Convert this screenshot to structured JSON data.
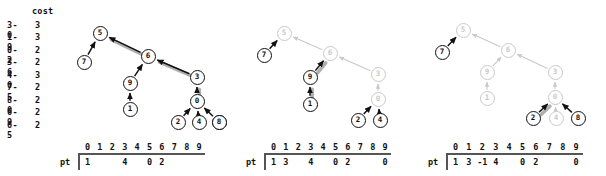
{
  "cost_table": {
    "header": "cost",
    "rows": [
      {
        "pair": "3-0",
        "cost": "3"
      },
      {
        "pair": "1-9",
        "cost": "3"
      },
      {
        "pair": "0-2",
        "cost": "2"
      },
      {
        "pair": "3-6",
        "cost": "2"
      },
      {
        "pair": "4-0",
        "cost": "3"
      },
      {
        "pair": "7-5",
        "cost": "2"
      },
      {
        "pair": "8-0",
        "cost": "2"
      },
      {
        "pair": "6-9",
        "cost": "2"
      },
      {
        "pair": "6-5",
        "cost": "2"
      }
    ]
  },
  "colors": {
    "ink": "#111111",
    "dim": "#c9c9c9",
    "highlight": "#b0b0b0",
    "rule": "#555555"
  },
  "panels": [
    {
      "name": "panel-1",
      "nodes": [
        {
          "id": "5",
          "x": 100,
          "y": 33,
          "state": "active"
        },
        {
          "id": "7",
          "x": 84,
          "y": 62,
          "state": "active"
        },
        {
          "id": "6",
          "x": 148,
          "y": 56,
          "state": "active"
        },
        {
          "id": "9",
          "x": 130,
          "y": 83,
          "state": "active"
        },
        {
          "id": "1",
          "x": 130,
          "y": 109,
          "state": "active"
        },
        {
          "id": "3",
          "x": 197,
          "y": 77,
          "state": "active"
        },
        {
          "id": "0",
          "x": 197,
          "y": 101,
          "state": "active"
        },
        {
          "id": "2",
          "x": 178,
          "y": 122,
          "state": "active"
        },
        {
          "id": "4",
          "x": 199,
          "y": 122,
          "state": "active"
        },
        {
          "id": "8",
          "x": 219,
          "y": 122,
          "state": "active"
        }
      ],
      "edges": [
        {
          "from": "7",
          "to": "5",
          "highlight": false
        },
        {
          "from": "6",
          "to": "5",
          "highlight": true
        },
        {
          "from": "9",
          "to": "6",
          "highlight": false
        },
        {
          "from": "1",
          "to": "9",
          "highlight": false
        },
        {
          "from": "3",
          "to": "6",
          "highlight": true
        },
        {
          "from": "0",
          "to": "3",
          "highlight": true
        },
        {
          "from": "2",
          "to": "0",
          "highlight": false
        },
        {
          "from": "4",
          "to": "0",
          "highlight": false
        },
        {
          "from": "8",
          "to": "0",
          "highlight": false
        }
      ],
      "pt": {
        "label": "pt",
        "indices": [
          "0",
          "1",
          "2",
          "3",
          "4",
          "5",
          "6",
          "7",
          "8",
          "9"
        ],
        "values": [
          "1",
          "",
          "",
          "4",
          "",
          "0",
          "2",
          "",
          "",
          ""
        ]
      }
    },
    {
      "name": "panel-2",
      "nodes": [
        {
          "id": "5",
          "x": 284,
          "y": 33,
          "state": "dim"
        },
        {
          "id": "7",
          "x": 264,
          "y": 55,
          "state": "active"
        },
        {
          "id": "6",
          "x": 330,
          "y": 53,
          "state": "dim"
        },
        {
          "id": "9",
          "x": 310,
          "y": 77,
          "state": "active"
        },
        {
          "id": "1",
          "x": 310,
          "y": 104,
          "state": "active"
        },
        {
          "id": "3",
          "x": 378,
          "y": 74,
          "state": "dim"
        },
        {
          "id": "0",
          "x": 378,
          "y": 99,
          "state": "dim"
        },
        {
          "id": "2",
          "x": 358,
          "y": 120,
          "state": "active"
        },
        {
          "id": "4",
          "x": 380,
          "y": 120,
          "state": "active"
        },
        {
          "id": "8",
          "x": 219,
          "y": 122,
          "state": "active"
        }
      ],
      "edges": [
        {
          "from": "7",
          "to": "5",
          "highlight": false
        },
        {
          "from": "6",
          "to": "5",
          "highlight": false
        },
        {
          "from": "9",
          "to": "6",
          "highlight": true
        },
        {
          "from": "1",
          "to": "9",
          "highlight": true
        },
        {
          "from": "3",
          "to": "6",
          "highlight": false
        },
        {
          "from": "0",
          "to": "3",
          "highlight": false
        },
        {
          "from": "2",
          "to": "0",
          "highlight": false
        },
        {
          "from": "4",
          "to": "0",
          "highlight": false
        }
      ],
      "pt": {
        "label": "pt",
        "indices": [
          "0",
          "1",
          "2",
          "3",
          "4",
          "5",
          "6",
          "7",
          "8",
          "9"
        ],
        "values": [
          "1",
          "3",
          "",
          "4",
          "",
          "0",
          "2",
          "",
          "",
          "0"
        ]
      }
    },
    {
      "name": "panel-3",
      "nodes": [
        {
          "id": "5",
          "x": 463,
          "y": 30,
          "state": "dim"
        },
        {
          "id": "7",
          "x": 442,
          "y": 52,
          "state": "active"
        },
        {
          "id": "6",
          "x": 508,
          "y": 50,
          "state": "dim"
        },
        {
          "id": "9",
          "x": 487,
          "y": 72,
          "state": "dim"
        },
        {
          "id": "1",
          "x": 487,
          "y": 98,
          "state": "dim"
        },
        {
          "id": "3",
          "x": 555,
          "y": 72,
          "state": "dim"
        },
        {
          "id": "0",
          "x": 555,
          "y": 97,
          "state": "dim"
        },
        {
          "id": "2",
          "x": 533,
          "y": 118,
          "state": "active"
        },
        {
          "id": "4",
          "x": 556,
          "y": 118,
          "state": "dim"
        },
        {
          "id": "8",
          "x": 578,
          "y": 118,
          "state": "active"
        }
      ],
      "edges": [
        {
          "from": "7",
          "to": "5",
          "highlight": false
        },
        {
          "from": "6",
          "to": "5",
          "highlight": false
        },
        {
          "from": "9",
          "to": "6",
          "highlight": false
        },
        {
          "from": "1",
          "to": "9",
          "highlight": false
        },
        {
          "from": "3",
          "to": "6",
          "highlight": false
        },
        {
          "from": "0",
          "to": "3",
          "highlight": false
        },
        {
          "from": "2",
          "to": "0",
          "highlight": true
        },
        {
          "from": "4",
          "to": "0",
          "highlight": false
        },
        {
          "from": "8",
          "to": "0",
          "highlight": false
        }
      ],
      "pt": {
        "label": "pt",
        "indices": [
          "0",
          "1",
          "2",
          "3",
          "4",
          "5",
          "6",
          "7",
          "8",
          "9"
        ],
        "values": [
          "1",
          "3",
          "-1",
          "4",
          "",
          "0",
          "2",
          "",
          "",
          "0"
        ]
      }
    }
  ],
  "pt_layouts": [
    {
      "left": 60,
      "grid_left": 18,
      "cell_w": 12.4,
      "width": 152
    },
    {
      "left": 246,
      "grid_left": 18,
      "cell_w": 12.4,
      "width": 152
    },
    {
      "left": 428,
      "grid_left": 18,
      "cell_w": 13.4,
      "width": 165
    }
  ]
}
